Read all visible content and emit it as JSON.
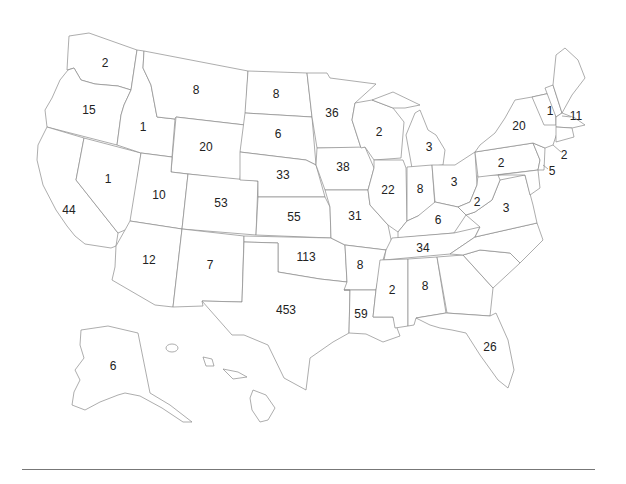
{
  "map": {
    "type": "choropleth-labels",
    "region": "United States",
    "label_color": "#222222",
    "border_color": "#8a8a8a",
    "background": "#ffffff"
  },
  "chart_data": {
    "type": "map",
    "title": "",
    "values_by_state": {
      "WA": 2,
      "OR": 15,
      "CA": 44,
      "NV": 1,
      "ID": 1,
      "MT": 8,
      "WY": 20,
      "UT": 10,
      "AZ": 12,
      "CO": 53,
      "NM": 7,
      "ND": 8,
      "SD": 6,
      "NE": 33,
      "KS": 55,
      "OK": 113,
      "TX": 453,
      "MN": 36,
      "IA": 38,
      "MO": 31,
      "AR": 8,
      "LA": 59,
      "WI": 2,
      "IL": 22,
      "MI": 3,
      "IN": 8,
      "OH": 3,
      "KY": 6,
      "TN": 34,
      "MS": 2,
      "AL": 8,
      "FL": 26,
      "WV": 2,
      "VA": 3,
      "PA": 2,
      "NY": 20,
      "NH": 1,
      "MA": 11,
      "CT": 2,
      "NJ": 5,
      "AK": 6
    }
  },
  "labels": [
    {
      "state": "WA",
      "text": "2",
      "x": 105,
      "y": 63
    },
    {
      "state": "OR",
      "text": "15",
      "x": 89,
      "y": 110
    },
    {
      "state": "CA",
      "text": "44",
      "x": 69,
      "y": 210
    },
    {
      "state": "NV",
      "text": "1",
      "x": 108,
      "y": 179
    },
    {
      "state": "ID",
      "text": "1",
      "x": 143,
      "y": 127
    },
    {
      "state": "MT",
      "text": "8",
      "x": 196,
      "y": 90
    },
    {
      "state": "WY",
      "text": "20",
      "x": 206,
      "y": 147
    },
    {
      "state": "UT",
      "text": "10",
      "x": 159,
      "y": 195
    },
    {
      "state": "AZ",
      "text": "12",
      "x": 149,
      "y": 260
    },
    {
      "state": "CO",
      "text": "53",
      "x": 221,
      "y": 203
    },
    {
      "state": "NM",
      "text": "7",
      "x": 210,
      "y": 265
    },
    {
      "state": "ND",
      "text": "8",
      "x": 276,
      "y": 94
    },
    {
      "state": "SD",
      "text": "6",
      "x": 278,
      "y": 134
    },
    {
      "state": "NE",
      "text": "33",
      "x": 283,
      "y": 175
    },
    {
      "state": "KS",
      "text": "55",
      "x": 294,
      "y": 217
    },
    {
      "state": "OK",
      "text": "113",
      "x": 306,
      "y": 257
    },
    {
      "state": "TX",
      "text": "453",
      "x": 286,
      "y": 310
    },
    {
      "state": "MN",
      "text": "36",
      "x": 332,
      "y": 113
    },
    {
      "state": "IA",
      "text": "38",
      "x": 343,
      "y": 167
    },
    {
      "state": "MO",
      "text": "31",
      "x": 355,
      "y": 216
    },
    {
      "state": "AR",
      "text": "8",
      "x": 360,
      "y": 265
    },
    {
      "state": "LA",
      "text": "59",
      "x": 361,
      "y": 314
    },
    {
      "state": "WI",
      "text": "2",
      "x": 379,
      "y": 132
    },
    {
      "state": "IL",
      "text": "22",
      "x": 388,
      "y": 190
    },
    {
      "state": "MI",
      "text": "3",
      "x": 429,
      "y": 147
    },
    {
      "state": "IN",
      "text": "8",
      "x": 420,
      "y": 189
    },
    {
      "state": "OH",
      "text": "3",
      "x": 454,
      "y": 182
    },
    {
      "state": "KY",
      "text": "6",
      "x": 438,
      "y": 220
    },
    {
      "state": "TN",
      "text": "34",
      "x": 423,
      "y": 248
    },
    {
      "state": "MS",
      "text": "2",
      "x": 392,
      "y": 290
    },
    {
      "state": "AL",
      "text": "8",
      "x": 425,
      "y": 286
    },
    {
      "state": "FL",
      "text": "26",
      "x": 490,
      "y": 347
    },
    {
      "state": "WV",
      "text": "2",
      "x": 477,
      "y": 202
    },
    {
      "state": "VA",
      "text": "3",
      "x": 506,
      "y": 208
    },
    {
      "state": "PA",
      "text": "2",
      "x": 501,
      "y": 163
    },
    {
      "state": "NY",
      "text": "20",
      "x": 519,
      "y": 126
    },
    {
      "state": "NH",
      "text": "1",
      "x": 550,
      "y": 111
    },
    {
      "state": "MA",
      "text": "11",
      "x": 576,
      "y": 116
    },
    {
      "state": "CT",
      "text": "2",
      "x": 564,
      "y": 155
    },
    {
      "state": "NJ",
      "text": "5",
      "x": 552,
      "y": 171
    },
    {
      "state": "AK",
      "text": "6",
      "x": 113,
      "y": 366
    }
  ]
}
